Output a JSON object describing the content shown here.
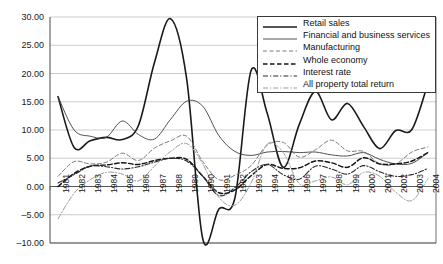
{
  "chart_data": {
    "type": "line",
    "title": "",
    "xlabel": "",
    "ylabel": "",
    "ylim": [
      -10.0,
      30.0
    ],
    "ytick_values": [
      30.0,
      25.0,
      20.0,
      15.0,
      10.0,
      5.0,
      0.0,
      -5.0,
      -10.0
    ],
    "ytick_labels": [
      "30.00",
      "25.00",
      "20.00",
      "15.00",
      "10.00",
      "5.00",
      "0.00",
      "-5.00",
      "-10.00"
    ],
    "grid": true,
    "grid_axis": "y",
    "legend_position": "upper right",
    "categories": [
      "1981",
      "1982",
      "1983",
      "1984",
      "1985",
      "1986",
      "1987",
      "1988",
      "1989",
      "1990",
      "1991",
      "1992",
      "1993",
      "1994",
      "1995",
      "1996",
      "1997",
      "1998",
      "1999",
      "2000",
      "2001",
      "2002",
      "2003",
      "2004"
    ],
    "series": [
      {
        "name": "Retail sales",
        "style": "solid",
        "width": 1.6,
        "color": "#1a1a1a",
        "values": [
          15.9,
          6.9,
          8.1,
          8.7,
          8.3,
          10.8,
          22.0,
          29.7,
          19.0,
          -9.3,
          -4.0,
          -2.0,
          20.5,
          13.0,
          3.4,
          11.0,
          16.8,
          11.8,
          14.7,
          10.6,
          6.7,
          9.9,
          10.1,
          18.3
        ]
      },
      {
        "name": "Financial and business services",
        "style": "solid",
        "width": 0.9,
        "color": "#3d3d3d",
        "values": [
          15.9,
          10.0,
          8.9,
          8.7,
          11.6,
          9.2,
          8.4,
          11.9,
          15.1,
          14.2,
          9.0,
          6.2,
          5.5,
          6.1,
          6.2,
          6.0,
          6.1,
          5.6,
          5.4,
          6.0,
          4.8,
          4.0,
          4.1,
          6.0
        ]
      },
      {
        "name": "Manufacturing",
        "style": "dashed",
        "width": 0.9,
        "color": "#6b6b6b",
        "values": [
          1.8,
          4.4,
          4.0,
          4.3,
          5.9,
          4.6,
          6.8,
          8.1,
          8.9,
          4.4,
          1.2,
          2.0,
          3.7,
          7.3,
          7.8,
          5.2,
          6.5,
          8.2,
          6.3,
          6.2,
          4.0,
          4.0,
          6.1,
          7.0
        ]
      },
      {
        "name": "Whole economy",
        "style": "dashed-bold",
        "width": 1.5,
        "color": "#151515",
        "values": [
          0.0,
          2.3,
          3.6,
          3.8,
          4.2,
          3.9,
          4.6,
          5.0,
          4.8,
          1.8,
          -1.1,
          -0.6,
          1.9,
          3.9,
          3.2,
          3.3,
          4.5,
          4.2,
          3.4,
          5.1,
          4.0,
          4.0,
          4.5,
          6.0
        ]
      },
      {
        "name": "Interest rate",
        "style": "dashdot",
        "width": 1.1,
        "color": "#2b2b2b",
        "values": [
          0.6,
          2.1,
          3.6,
          3.5,
          3.1,
          3.5,
          4.3,
          5.0,
          4.5,
          1.8,
          -1.6,
          -0.2,
          2.6,
          3.9,
          2.1,
          1.3,
          3.6,
          3.1,
          2.2,
          3.7,
          2.6,
          1.8,
          2.1,
          3.2
        ]
      },
      {
        "name": "All property total return",
        "style": "dashdot-light",
        "width": 1.0,
        "color": "#9a9a9a",
        "values": [
          -5.7,
          -1.2,
          1.2,
          2.5,
          2.2,
          1.0,
          3.6,
          6.2,
          7.6,
          4.0,
          -1.9,
          -3.3,
          0.6,
          7.5,
          6.0,
          0.5,
          1.0,
          1.7,
          0.3,
          2.5,
          1.8,
          -1.0,
          -2.5,
          1.4
        ]
      }
    ],
    "legend_entries": [
      "Retail sales",
      "Financial and business services",
      "Manufacturing",
      "Whole economy",
      "Interest rate",
      "All property total return"
    ]
  },
  "layout": {
    "plot_left": 50,
    "plot_right": 436,
    "plot_top": 17,
    "plot_bottom": 243,
    "axis_color": "#4a4a4a",
    "grid_color": "#b8b8b8",
    "background": "#ffffff"
  }
}
